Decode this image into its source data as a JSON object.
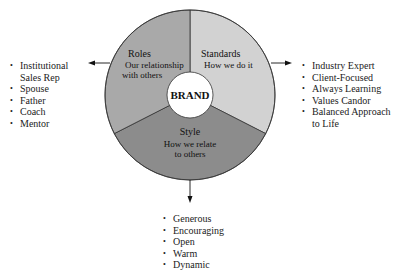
{
  "center": {
    "label": "BRAND"
  },
  "segments": [
    {
      "id": "roles",
      "title": "Roles",
      "subtitle_lines": [
        "Our relationship",
        "with others"
      ],
      "fill": "#a9a9a9"
    },
    {
      "id": "standards",
      "title": "Standards",
      "subtitle_lines": [
        "How we do it"
      ],
      "fill": "#d2d2d2"
    },
    {
      "id": "style",
      "title": "Style",
      "subtitle_lines": [
        "How we relate",
        "to others"
      ],
      "fill": "#8c8c8c"
    }
  ],
  "lists": {
    "roles": [
      "Institutional",
      "Sales Rep",
      "Spouse",
      "Father",
      "Coach",
      "Mentor"
    ],
    "standards": [
      "Industry Expert",
      "Client-Focused",
      "Always Learning",
      "Values Candor",
      "Balanced Approach",
      "to Life"
    ],
    "style": [
      "Generous",
      "Encouraging",
      "Open",
      "Warm",
      "Dynamic"
    ]
  },
  "arrows": [
    {
      "from": "roles",
      "direction": "left"
    },
    {
      "from": "standards",
      "direction": "right"
    },
    {
      "from": "style",
      "direction": "down"
    }
  ]
}
